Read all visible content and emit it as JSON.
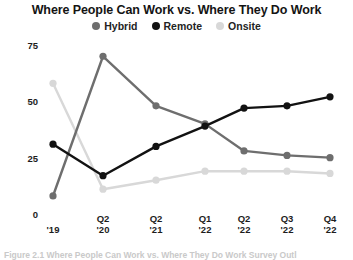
{
  "chart_data": {
    "type": "line",
    "title": "Where People Can Work vs. Where They Do Work",
    "xlabel": "",
    "ylabel": "",
    "ylim": [
      0,
      78
    ],
    "yticks": [
      0,
      25,
      50,
      75
    ],
    "grid": false,
    "legend_position": "top-center",
    "categories": [
      "'19",
      "Q2 '20",
      "Q2 '21",
      "Q1 '22",
      "Q2 '22",
      "Q3 '22",
      "Q4 '22"
    ],
    "x_tick_lines": [
      {
        "top": "'19",
        "bottom": ""
      },
      {
        "top": "Q2",
        "bottom": "'20"
      },
      {
        "top": "Q2",
        "bottom": "'21"
      },
      {
        "top": "Q1",
        "bottom": "'22"
      },
      {
        "top": "Q2",
        "bottom": "'22"
      },
      {
        "top": "Q3",
        "bottom": "'22"
      },
      {
        "top": "Q4",
        "bottom": "'22"
      }
    ],
    "series": [
      {
        "name": "Hybrid",
        "color": "#6e6e6e",
        "values": [
          8,
          70,
          48,
          40,
          28,
          26,
          25
        ]
      },
      {
        "name": "Remote",
        "color": "#121212",
        "values": [
          31,
          17,
          30,
          39,
          47,
          48,
          52
        ]
      },
      {
        "name": "Onsite",
        "color": "#d8d8d8",
        "values": [
          58,
          11,
          15,
          19,
          19,
          19,
          18
        ]
      }
    ]
  },
  "legend": [
    {
      "label": "Hybrid",
      "color": "#6e6e6e"
    },
    {
      "label": "Remote",
      "color": "#121212"
    },
    {
      "label": "Onsite",
      "color": "#d8d8d8"
    }
  ],
  "caption": "Figure 2.1 Where People Can Work vs. Where They Do Work Survey Outl"
}
